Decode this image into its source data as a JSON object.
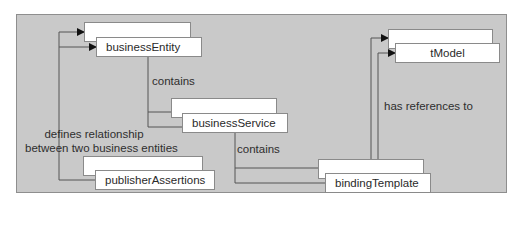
{
  "diagram": {
    "colors": {
      "panel_fill": "#c9c9c9",
      "panel_border": "#8e8e8e",
      "box_fill": "#ffffff",
      "box_border": "#8a8a8a",
      "line": "#555555",
      "text": "#2a2a2a"
    },
    "nodes": [
      {
        "id": "businessEntity",
        "label": "businessEntity"
      },
      {
        "id": "businessService",
        "label": "businessService"
      },
      {
        "id": "bindingTemplate",
        "label": "bindingTemplate"
      },
      {
        "id": "tModel",
        "label": "tModel"
      },
      {
        "id": "publisherAssertions",
        "label": "publisherAssertions"
      }
    ],
    "edges": [
      {
        "from": "businessEntity",
        "to": "businessService",
        "label": "contains"
      },
      {
        "from": "businessService",
        "to": "bindingTemplate",
        "label": "contains"
      },
      {
        "from": "bindingTemplate",
        "to": "tModel",
        "label": "has references to"
      },
      {
        "from": "publisherAssertions",
        "to": "businessEntity",
        "label": "defines relationship between two business entities"
      }
    ],
    "labels": {
      "contains_1": "contains",
      "contains_2": "contains",
      "has_references_to": "has references to",
      "defines_line1": "defines relationship",
      "defines_line2": "between two business entities"
    }
  }
}
